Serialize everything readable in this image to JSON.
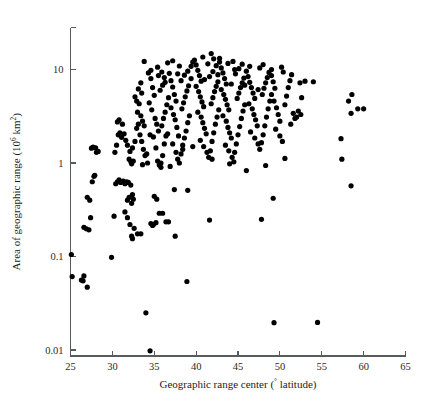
{
  "figure": {
    "background_color": "#ffffff",
    "point_color": "#000000",
    "axis_color": "#555b5e"
  },
  "axes": {
    "x_title_main": "Geographic range center (",
    "x_title_degree": "°",
    "x_title_tail": " latitude)",
    "x_title_full": "Geographic range center (° latitude)",
    "y_title_main": "Area of geographic range (10",
    "y_title_sup": "6",
    "y_title_mid": " km",
    "y_title_sup2": "2",
    "y_title_tail": ")",
    "y_title_full": "Area of geographic range (10⁶ km²)",
    "x_ticks": [
      "25",
      "30",
      "35",
      "40",
      "45",
      "50",
      "55",
      "60",
      "65"
    ],
    "y_ticks": [
      "0.01",
      "0.1",
      "1",
      "10"
    ]
  },
  "chart_data": {
    "type": "scatter",
    "title": "",
    "xlabel": "Geographic range center (° latitude)",
    "ylabel": "Area of geographic range (10⁶ km²)",
    "xlim": [
      25,
      65
    ],
    "ylim": [
      0.01,
      20
    ],
    "yscale": "log",
    "xscale": "linear",
    "grid": false,
    "legend": null,
    "marker": {
      "shape": "circle",
      "color": "#000000",
      "size": 2.6
    },
    "xticks": [
      25,
      30,
      35,
      40,
      45,
      50,
      55,
      60,
      65
    ],
    "yticks": [
      0.01,
      0.1,
      1,
      10
    ],
    "n_points": 311,
    "points": [
      [
        25.1,
        0.105
      ],
      [
        25.2,
        0.061
      ],
      [
        26.3,
        0.056
      ],
      [
        26.5,
        0.055
      ],
      [
        26.6,
        0.062
      ],
      [
        27.0,
        0.047
      ],
      [
        26.6,
        0.205
      ],
      [
        26.9,
        0.198
      ],
      [
        27.2,
        0.193
      ],
      [
        27.0,
        0.43
      ],
      [
        27.3,
        0.4
      ],
      [
        27.4,
        0.26
      ],
      [
        27.6,
        0.63
      ],
      [
        27.8,
        0.72
      ],
      [
        27.9,
        0.74
      ],
      [
        27.5,
        1.44
      ],
      [
        27.7,
        1.48
      ],
      [
        28.0,
        1.45
      ],
      [
        28.3,
        1.33
      ],
      [
        28.1,
        1.3
      ],
      [
        29.9,
        0.098
      ],
      [
        30.2,
        0.27
      ],
      [
        30.4,
        0.6
      ],
      [
        30.6,
        0.63
      ],
      [
        30.8,
        0.66
      ],
      [
        31.0,
        0.62
      ],
      [
        31.3,
        0.64
      ],
      [
        31.5,
        0.6
      ],
      [
        31.7,
        0.63
      ],
      [
        31.9,
        0.62
      ],
      [
        32.2,
        0.58
      ],
      [
        32.4,
        0.46
      ],
      [
        32.0,
        0.43
      ],
      [
        31.8,
        0.4
      ],
      [
        32.3,
        0.37
      ],
      [
        32.5,
        0.41
      ],
      [
        31.5,
        0.3
      ],
      [
        31.8,
        0.26
      ],
      [
        32.1,
        0.22
      ],
      [
        32.3,
        0.165
      ],
      [
        32.4,
        0.155
      ],
      [
        32.6,
        0.2
      ],
      [
        33.0,
        0.175
      ],
      [
        33.4,
        0.175
      ],
      [
        34.0,
        0.025
      ],
      [
        34.5,
        0.0098
      ],
      [
        34.6,
        0.225
      ],
      [
        34.8,
        0.215
      ],
      [
        34.9,
        0.22
      ],
      [
        35.2,
        0.23
      ],
      [
        35.0,
        0.44
      ],
      [
        35.3,
        0.41
      ],
      [
        35.6,
        0.29
      ],
      [
        36.0,
        0.29
      ],
      [
        36.4,
        0.235
      ],
      [
        36.7,
        0.235
      ],
      [
        37.4,
        0.52
      ],
      [
        37.5,
        0.165
      ],
      [
        38.9,
        0.054
      ],
      [
        39.0,
        0.51
      ],
      [
        41.6,
        0.245
      ],
      [
        44.5,
        1.03
      ],
      [
        46.0,
        0.83
      ],
      [
        47.8,
        0.25
      ],
      [
        48.3,
        0.94
      ],
      [
        49.2,
        0.42
      ],
      [
        49.3,
        0.0196
      ],
      [
        54.5,
        0.0197
      ],
      [
        50.6,
        1.12
      ],
      [
        57.4,
        1.1
      ],
      [
        58.5,
        0.57
      ],
      [
        57.3,
        1.82
      ],
      [
        30.3,
        1.3
      ],
      [
        30.5,
        1.55
      ],
      [
        30.7,
        2.0
      ],
      [
        30.9,
        2.1
      ],
      [
        31.1,
        1.88
      ],
      [
        30.6,
        2.75
      ],
      [
        30.8,
        2.9
      ],
      [
        31.2,
        2.6
      ],
      [
        31.4,
        2.05
      ],
      [
        31.6,
        1.75
      ],
      [
        31.8,
        1.55
      ],
      [
        32.0,
        1.1
      ],
      [
        32.2,
        1.03
      ],
      [
        32.3,
        0.98
      ],
      [
        32.5,
        1.05
      ],
      [
        32.1,
        1.33
      ],
      [
        32.4,
        1.45
      ],
      [
        32.7,
        1.7
      ],
      [
        32.9,
        2.35
      ],
      [
        33.1,
        2.6
      ],
      [
        33.3,
        2.0
      ],
      [
        33.5,
        1.7
      ],
      [
        33.7,
        1.4
      ],
      [
        33.9,
        1.2
      ],
      [
        34.1,
        1.25
      ],
      [
        33.0,
        3.5
      ],
      [
        33.2,
        4.3
      ],
      [
        33.4,
        3.2
      ],
      [
        33.6,
        2.8
      ],
      [
        33.8,
        2.5
      ],
      [
        32.7,
        5.1
      ],
      [
        32.9,
        4.6
      ],
      [
        33.5,
        5.6
      ],
      [
        33.1,
        6.2
      ],
      [
        33.4,
        7.2
      ],
      [
        33.8,
        12.2
      ],
      [
        34.3,
        9.2
      ],
      [
        34.6,
        8.0
      ],
      [
        34.8,
        6.4
      ],
      [
        35.0,
        5.3
      ],
      [
        34.4,
        4.4
      ],
      [
        34.7,
        3.7
      ],
      [
        35.1,
        3.0
      ],
      [
        35.3,
        2.6
      ],
      [
        35.5,
        2.2
      ],
      [
        34.5,
        2.0
      ],
      [
        34.9,
        1.9
      ],
      [
        35.2,
        1.45
      ],
      [
        35.4,
        1.05
      ],
      [
        35.6,
        0.95
      ],
      [
        35.8,
        1.0
      ],
      [
        36.0,
        1.2
      ],
      [
        36.2,
        1.6
      ],
      [
        36.4,
        1.95
      ],
      [
        36.6,
        2.05
      ],
      [
        35.9,
        2.5
      ],
      [
        36.1,
        3.0
      ],
      [
        36.3,
        3.5
      ],
      [
        36.5,
        4.2
      ],
      [
        36.7,
        5.0
      ],
      [
        35.7,
        6.0
      ],
      [
        36.0,
        6.8
      ],
      [
        36.3,
        7.3
      ],
      [
        35.5,
        8.6
      ],
      [
        35.9,
        9.4
      ],
      [
        36.8,
        9.1
      ],
      [
        37.0,
        7.6
      ],
      [
        37.2,
        6.5
      ],
      [
        37.4,
        5.4
      ],
      [
        37.6,
        4.6
      ],
      [
        37.0,
        3.9
      ],
      [
        37.3,
        3.3
      ],
      [
        37.5,
        2.9
      ],
      [
        37.7,
        2.4
      ],
      [
        37.9,
        1.95
      ],
      [
        37.2,
        1.6
      ],
      [
        37.6,
        1.3
      ],
      [
        37.8,
        1.1
      ],
      [
        38.0,
        1.0
      ],
      [
        38.2,
        1.25
      ],
      [
        38.4,
        1.55
      ],
      [
        38.6,
        1.85
      ],
      [
        38.8,
        2.2
      ],
      [
        39.0,
        2.7
      ],
      [
        39.2,
        3.2
      ],
      [
        38.3,
        3.8
      ],
      [
        38.5,
        4.4
      ],
      [
        38.7,
        5.1
      ],
      [
        38.9,
        5.9
      ],
      [
        39.1,
        6.7
      ],
      [
        38.2,
        7.6
      ],
      [
        38.6,
        8.7
      ],
      [
        39.0,
        9.6
      ],
      [
        39.4,
        10.8
      ],
      [
        39.6,
        12.0
      ],
      [
        39.8,
        12.6
      ],
      [
        40.0,
        11.2
      ],
      [
        40.2,
        9.8
      ],
      [
        40.4,
        8.6
      ],
      [
        40.6,
        7.5
      ],
      [
        40.0,
        6.6
      ],
      [
        40.3,
        5.8
      ],
      [
        40.5,
        5.1
      ],
      [
        40.7,
        4.5
      ],
      [
        40.9,
        4.0
      ],
      [
        40.2,
        3.5
      ],
      [
        40.6,
        3.1
      ],
      [
        40.8,
        2.7
      ],
      [
        41.0,
        2.35
      ],
      [
        41.2,
        2.05
      ],
      [
        40.5,
        1.75
      ],
      [
        40.9,
        1.5
      ],
      [
        41.3,
        1.3
      ],
      [
        41.5,
        1.15
      ],
      [
        41.7,
        1.35
      ],
      [
        41.9,
        1.7
      ],
      [
        42.1,
        2.1
      ],
      [
        42.3,
        2.6
      ],
      [
        42.5,
        3.1
      ],
      [
        42.7,
        3.7
      ],
      [
        41.8,
        4.3
      ],
      [
        42.0,
        5.0
      ],
      [
        42.2,
        5.8
      ],
      [
        42.4,
        6.6
      ],
      [
        42.6,
        7.4
      ],
      [
        41.6,
        8.4
      ],
      [
        42.0,
        9.5
      ],
      [
        42.4,
        11.0
      ],
      [
        42.1,
        13.0
      ],
      [
        41.8,
        14.8
      ],
      [
        42.8,
        12.0
      ],
      [
        43.0,
        10.4
      ],
      [
        43.2,
        9.2
      ],
      [
        43.4,
        8.0
      ],
      [
        43.6,
        7.0
      ],
      [
        43.0,
        6.1
      ],
      [
        43.3,
        5.4
      ],
      [
        43.5,
        4.8
      ],
      [
        43.7,
        4.2
      ],
      [
        43.9,
        3.7
      ],
      [
        43.2,
        3.2
      ],
      [
        43.6,
        2.8
      ],
      [
        43.8,
        2.4
      ],
      [
        44.0,
        2.1
      ],
      [
        44.2,
        1.85
      ],
      [
        43.5,
        1.55
      ],
      [
        43.9,
        1.35
      ],
      [
        44.3,
        1.15
      ],
      [
        44.6,
        1.3
      ],
      [
        44.8,
        1.6
      ],
      [
        45.0,
        2.0
      ],
      [
        45.2,
        2.45
      ],
      [
        45.4,
        3.0
      ],
      [
        45.6,
        3.6
      ],
      [
        45.8,
        4.2
      ],
      [
        44.9,
        4.9
      ],
      [
        45.1,
        5.6
      ],
      [
        45.3,
        6.4
      ],
      [
        45.5,
        7.2
      ],
      [
        45.7,
        8.1
      ],
      [
        44.7,
        9.0
      ],
      [
        45.1,
        10.2
      ],
      [
        45.5,
        11.4
      ],
      [
        44.4,
        12.2
      ],
      [
        46.0,
        9.6
      ],
      [
        46.2,
        8.4
      ],
      [
        46.4,
        7.3
      ],
      [
        46.6,
        6.4
      ],
      [
        46.8,
        5.6
      ],
      [
        47.0,
        4.9
      ],
      [
        46.3,
        4.3
      ],
      [
        46.7,
        3.8
      ],
      [
        46.9,
        3.3
      ],
      [
        47.1,
        2.9
      ],
      [
        47.3,
        2.5
      ],
      [
        46.5,
        2.15
      ],
      [
        47.0,
        1.85
      ],
      [
        47.4,
        1.6
      ],
      [
        47.6,
        1.4
      ],
      [
        47.8,
        1.65
      ],
      [
        48.0,
        2.0
      ],
      [
        48.2,
        2.5
      ],
      [
        48.4,
        3.1
      ],
      [
        48.6,
        3.8
      ],
      [
        48.8,
        4.6
      ],
      [
        47.9,
        5.4
      ],
      [
        48.1,
        6.3
      ],
      [
        48.3,
        7.2
      ],
      [
        48.5,
        8.2
      ],
      [
        48.7,
        9.3
      ],
      [
        47.6,
        10.4
      ],
      [
        48.0,
        11.3
      ],
      [
        49.0,
        8.6
      ],
      [
        49.2,
        7.4
      ],
      [
        49.4,
        6.3
      ],
      [
        49.0,
        5.4
      ],
      [
        49.3,
        4.6
      ],
      [
        49.6,
        3.9
      ],
      [
        49.8,
        3.3
      ],
      [
        50.0,
        2.8
      ],
      [
        49.5,
        2.3
      ],
      [
        50.0,
        1.95
      ],
      [
        50.3,
        1.7
      ],
      [
        50.6,
        4.2
      ],
      [
        50.8,
        5.2
      ],
      [
        51.0,
        6.4
      ],
      [
        51.2,
        7.6
      ],
      [
        51.4,
        8.8
      ],
      [
        50.4,
        9.4
      ],
      [
        50.2,
        10.6
      ],
      [
        51.6,
        3.4
      ],
      [
        51.8,
        3.0
      ],
      [
        52.0,
        3.1
      ],
      [
        52.2,
        3.6
      ],
      [
        51.3,
        2.6
      ],
      [
        52.4,
        7.2
      ],
      [
        53.0,
        7.5
      ],
      [
        52.6,
        5.0
      ],
      [
        34.6,
        9.8
      ],
      [
        36.2,
        8.2
      ],
      [
        37.8,
        9.0
      ],
      [
        39.4,
        8.0
      ],
      [
        41.0,
        7.8
      ],
      [
        42.6,
        8.8
      ],
      [
        44.2,
        7.0
      ],
      [
        45.8,
        6.8
      ],
      [
        47.4,
        6.1
      ],
      [
        49.0,
        10.0
      ],
      [
        35.4,
        10.6
      ],
      [
        38.0,
        10.9
      ],
      [
        40.8,
        13.6
      ],
      [
        43.8,
        11.6
      ],
      [
        46.4,
        10.8
      ],
      [
        36.6,
        11.8
      ],
      [
        41.4,
        11.5
      ],
      [
        44.6,
        10.0
      ],
      [
        37.2,
        12.4
      ],
      [
        42.8,
        13.2
      ],
      [
        58.6,
        5.4
      ],
      [
        58.2,
        4.6
      ],
      [
        58.5,
        3.4
      ],
      [
        59.3,
        3.8
      ],
      [
        60.0,
        3.8
      ],
      [
        54.0,
        7.4
      ],
      [
        52.5,
        3.3
      ],
      [
        44.0,
        0.98
      ],
      [
        41.9,
        1.1
      ],
      [
        39.6,
        1.5
      ],
      [
        38.4,
        1.4
      ],
      [
        36.9,
        0.92
      ],
      [
        35.8,
        0.9
      ],
      [
        34.2,
        1.0
      ],
      [
        33.6,
        0.96
      ]
    ]
  }
}
